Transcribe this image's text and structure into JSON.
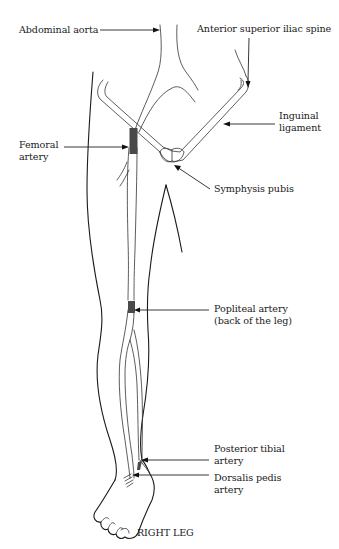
{
  "figure": {
    "title": "RIGHT LEG",
    "type": "anatomical diagram of leg arteries and pulse points"
  },
  "labels": {
    "abdominal_aorta": "Abdominal aorta",
    "asis": "Anterior superior iliac spine",
    "inguinal_line1": "Inguinal",
    "inguinal_line2": "ligament",
    "femoral_line1": "Femoral",
    "femoral_line2": "artery",
    "symphysis": "Symphysis pubis",
    "popliteal_line1": "Popliteal artery",
    "popliteal_line2": "(back of the leg)",
    "posterior_tibial_line1": "Posterior tibial",
    "posterior_tibial_line2": "artery",
    "dorsalis_line1": "Dorsalis pedis",
    "dorsalis_line2": "artery",
    "caption": "RIGHT LEG"
  },
  "colors": {
    "line": "#1a1a1a",
    "pulse_marker": "#4a4a4a",
    "background": "#ffffff"
  }
}
